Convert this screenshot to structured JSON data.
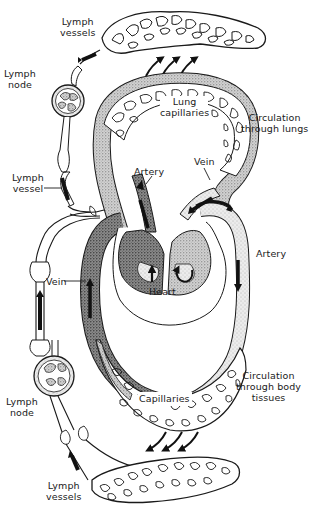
{
  "diagram": {
    "colors": {
      "ink": "#1a1a1a",
      "stipple_dark": "#6b6b6b",
      "stipple_light": "#bdbdbd",
      "background": "#ffffff"
    },
    "labels": {
      "lymph_vessels_top": {
        "line1": "Lymph",
        "line2": "vessels"
      },
      "lymph_node_top": {
        "line1": "Lymph",
        "line2": "node"
      },
      "lymph_vessel_mid": {
        "line1": "Lymph",
        "line2": "vessel"
      },
      "lung_capillaries": {
        "line1": "Lung",
        "line2": "capillaries"
      },
      "circulation_lungs": {
        "line1": "Circulation",
        "line2": "through lungs"
      },
      "artery_upper": "Artery",
      "vein_upper": "Vein",
      "artery_right": "Artery",
      "vein_left": "Vein",
      "heart": "Heart",
      "circulation_body": {
        "line1": "Circulation",
        "line2": "through body",
        "line3": "tissues"
      },
      "capillaries": "Capillaries",
      "lymph_node_bottom": {
        "line1": "Lymph",
        "line2": "node"
      },
      "lymph_vessels_bottom": {
        "line1": "Lymph",
        "line2": "vessels"
      }
    },
    "nodes": [
      {
        "id": "lymph-vessels-top",
        "type": "capillary-network"
      },
      {
        "id": "lymph-node-top",
        "type": "node"
      },
      {
        "id": "lung-capillaries",
        "type": "capillary-network"
      },
      {
        "id": "heart",
        "type": "organ"
      },
      {
        "id": "body-capillaries",
        "type": "capillary-network"
      },
      {
        "id": "lymph-node-bottom",
        "type": "node"
      },
      {
        "id": "lymph-vessels-bottom",
        "type": "capillary-network"
      }
    ],
    "flows": [
      {
        "from": "heart",
        "to": "lung-capillaries",
        "via": "Artery"
      },
      {
        "from": "lung-capillaries",
        "to": "heart",
        "via": "Vein"
      },
      {
        "from": "heart",
        "to": "body-capillaries",
        "via": "Artery"
      },
      {
        "from": "body-capillaries",
        "to": "heart",
        "via": "Vein"
      },
      {
        "from": "lung-capillaries",
        "to": "lymph-vessels-top",
        "via": "fluid"
      },
      {
        "from": "body-capillaries",
        "to": "lymph-vessels-bottom",
        "via": "fluid"
      },
      {
        "from": "lymph-vessels-top",
        "to": "lymph-node-top",
        "via": "Lymph vessel"
      },
      {
        "from": "lymph-vessels-bottom",
        "to": "lymph-node-bottom",
        "via": "Lymph vessels"
      },
      {
        "from": "lymph-node-top",
        "to": "heart",
        "via": "Lymph vessel"
      },
      {
        "from": "lymph-node-bottom",
        "to": "heart",
        "via": "Lymph vessel"
      }
    ]
  }
}
